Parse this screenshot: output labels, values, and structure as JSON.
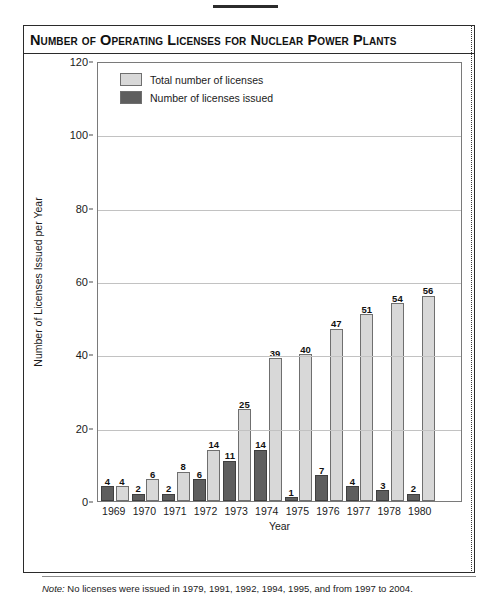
{
  "title": "Number of Operating Licenses for Nuclear Power Plants",
  "footnote": {
    "prefix": "Note:",
    "text": " No licenses were issued in 1979, 1991, 1992, 1994, 1995, and from 1997 to 2004."
  },
  "colors": {
    "total": "#d8d8d8",
    "issued": "#5e5e5e",
    "frame": "#2b2b2b",
    "grid": "#c2c2c2",
    "text": "#1a1a1a"
  },
  "chart_data": {
    "type": "bar",
    "title": "Number of Operating Licenses for Nuclear Power Plants",
    "xlabel": "Year",
    "ylabel": "Number of Licenses Issued per Year",
    "ylim": [
      0,
      120
    ],
    "yticks": [
      0,
      20,
      40,
      60,
      80,
      100,
      120
    ],
    "grid": true,
    "legend_position": "top-left inside plot",
    "categories": [
      "1969",
      "1970",
      "1971",
      "1972",
      "1973",
      "1974",
      "1975",
      "1976",
      "1977",
      "1978",
      "1980"
    ],
    "series": [
      {
        "name": "Number of licenses issued",
        "color": "#5e5e5e",
        "values": [
          4,
          2,
          2,
          6,
          11,
          14,
          1,
          7,
          4,
          3,
          2
        ]
      },
      {
        "name": "Total number of licenses",
        "color": "#d8d8d8",
        "values": [
          4,
          6,
          8,
          14,
          25,
          39,
          40,
          47,
          51,
          54,
          56
        ]
      }
    ],
    "notes": "No licenses were issued in 1979, 1991, 1992, 1994, 1995, and from 1997 to 2004."
  }
}
